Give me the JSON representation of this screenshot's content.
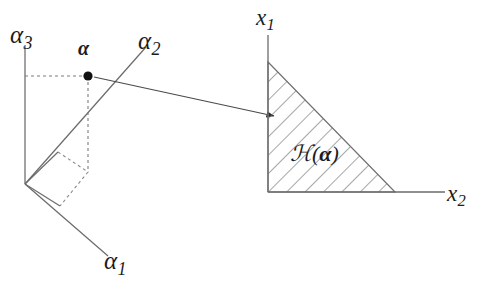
{
  "figure": {
    "background_color": "#ffffff",
    "line_color": "#555555",
    "text_color": "#1c1c1c",
    "point_color": "#111111"
  },
  "left_panel": {
    "name": "parameter-space-diagram",
    "axes": [
      {
        "id": "alpha3",
        "label": "α",
        "subscript": "3",
        "orientation": "vertical-up"
      },
      {
        "id": "alpha2",
        "label": "α",
        "subscript": "2",
        "orientation": "oblique-up-right"
      },
      {
        "id": "alpha1",
        "label": "α",
        "subscript": "1",
        "orientation": "oblique-down-right"
      }
    ],
    "point": {
      "label": "α",
      "style": "bold",
      "marker": "filled-circle"
    },
    "projection_lines": "dashed",
    "base_parallelogram": "dashed"
  },
  "right_panel": {
    "name": "cone-diagram",
    "axes": [
      {
        "id": "x1",
        "label": "x",
        "subscript": "1",
        "orientation": "vertical-up"
      },
      {
        "id": "x2",
        "label": "x",
        "subscript": "2",
        "orientation": "horizontal-right"
      }
    ],
    "region": {
      "label_script": "ℋ",
      "label_open": "(",
      "label_arg": "α",
      "label_close": ")",
      "fill": "hatched",
      "hatch_angle_deg": 45,
      "shape": "right-triangle"
    }
  },
  "connector": {
    "name": "mapping-arrow",
    "from": "alpha-point",
    "to": "cone-region",
    "arrowhead": "filled-triangle"
  }
}
